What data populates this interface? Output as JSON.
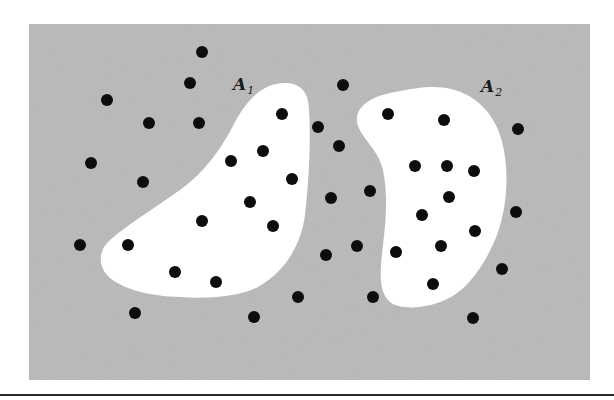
{
  "figure": {
    "background_color": "#ffffff",
    "field": {
      "color": "#b9b9b9",
      "x": 29,
      "y": 24,
      "width": 561,
      "height": 356
    },
    "baseline_rule": {
      "y": 395,
      "color": "#2a2a2a",
      "thickness": 2
    },
    "point_color": "#0d0d0d",
    "point_radius": 6,
    "regions": [
      {
        "id": "A1",
        "label": "A",
        "subscript": "1",
        "label_pos": [
          233,
          90
        ],
        "fill": "#ffffff",
        "path": "M 283 83 C 300 82 309 92 309 110 C 311 140 309 180 305 215 C 301 245 285 272 258 287 C 238 297 205 299 180 297 C 150 296 125 290 110 278 C 98 268 98 252 108 242 C 125 226 155 208 180 190 C 205 172 222 148 235 122 C 247 100 262 84 283 83 Z",
        "points": [
          [
            282,
            114
          ],
          [
            263,
            151
          ],
          [
            231,
            161
          ],
          [
            292,
            179
          ],
          [
            250,
            202
          ],
          [
            202,
            221
          ],
          [
            273,
            226
          ],
          [
            128,
            245
          ],
          [
            175,
            272
          ],
          [
            216,
            282
          ]
        ]
      },
      {
        "id": "A2",
        "label": "A",
        "subscript": "2",
        "label_pos": [
          481,
          92
        ],
        "fill": "#ffffff",
        "path": "M 433 87 C 465 87 490 105 500 135 C 510 165 508 205 497 235 C 485 265 468 290 445 300 C 425 309 400 310 390 302 C 378 292 380 270 383 245 C 386 220 388 195 383 170 C 378 148 360 138 357 122 C 355 106 372 96 395 92 C 410 89 422 87 433 87 Z",
        "points": [
          [
            388,
            114
          ],
          [
            444,
            120
          ],
          [
            415,
            166
          ],
          [
            447,
            166
          ],
          [
            474,
            171
          ],
          [
            449,
            197
          ],
          [
            422,
            215
          ],
          [
            475,
            231
          ],
          [
            441,
            246
          ],
          [
            396,
            252
          ],
          [
            433,
            284
          ]
        ]
      }
    ],
    "outside_points": [
      [
        202,
        52
      ],
      [
        190,
        83
      ],
      [
        107,
        100
      ],
      [
        343,
        85
      ],
      [
        149,
        123
      ],
      [
        199,
        123
      ],
      [
        318,
        127
      ],
      [
        339,
        146
      ],
      [
        518,
        129
      ],
      [
        91,
        163
      ],
      [
        143,
        182
      ],
      [
        370,
        191
      ],
      [
        331,
        198
      ],
      [
        516,
        212
      ],
      [
        80,
        245
      ],
      [
        357,
        246
      ],
      [
        326,
        255
      ],
      [
        502,
        269
      ],
      [
        298,
        297
      ],
      [
        373,
        297
      ],
      [
        135,
        313
      ],
      [
        254,
        317
      ],
      [
        473,
        318
      ]
    ]
  }
}
